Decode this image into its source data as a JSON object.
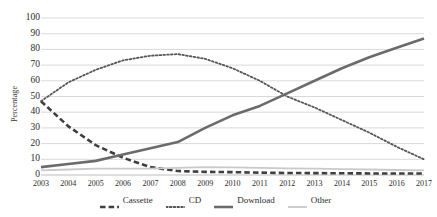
{
  "chart_data": {
    "type": "line",
    "title": "",
    "xlabel": "",
    "ylabel": "Percentage",
    "x": [
      2003,
      2004,
      2005,
      2006,
      2007,
      2008,
      2009,
      2010,
      2011,
      2012,
      2013,
      2014,
      2015,
      2016,
      2017
    ],
    "categories": [
      "2003",
      "2004",
      "2005",
      "2006",
      "2007",
      "2008",
      "2009",
      "2010",
      "2011",
      "2012",
      "2013",
      "2014",
      "2015",
      "2016",
      "2017"
    ],
    "xlim": [
      2003,
      2017
    ],
    "ylim": [
      0,
      100
    ],
    "yticks": [
      0,
      10,
      20,
      30,
      40,
      50,
      60,
      70,
      80,
      90,
      100
    ],
    "ytick_labels": [
      "0",
      "10",
      "20",
      "30",
      "40",
      "50",
      "60",
      "70",
      "80",
      "90",
      "100"
    ],
    "grid": "horizontal",
    "legend_position": "bottom",
    "series": [
      {
        "name": "Cassette",
        "style": "dashed",
        "color": "#3f3f3f",
        "width": 2.6,
        "values": [
          47,
          31,
          19,
          11,
          5,
          2.5,
          2,
          1.8,
          1.5,
          1.3,
          1.2,
          1.1,
          1,
          1,
          1
        ]
      },
      {
        "name": "CD",
        "style": "dotted",
        "color": "#555555",
        "width": 1.8,
        "values": [
          47,
          59,
          67,
          73,
          76,
          77,
          74,
          68,
          60,
          50,
          43,
          35,
          27,
          18,
          10
        ]
      },
      {
        "name": "Download",
        "style": "solid",
        "color": "#6b6b6b",
        "width": 2.6,
        "values": [
          5,
          7,
          9,
          13,
          17,
          21,
          30,
          38,
          44,
          52,
          60,
          68,
          75,
          81,
          87
        ]
      },
      {
        "name": "Other",
        "style": "solid",
        "color": "#c9c9c9",
        "width": 1.8,
        "values": [
          3,
          3.5,
          4,
          4,
          4,
          4.5,
          5,
          4.8,
          4.5,
          4.2,
          4,
          3.8,
          3.5,
          3.2,
          3
        ]
      }
    ]
  }
}
